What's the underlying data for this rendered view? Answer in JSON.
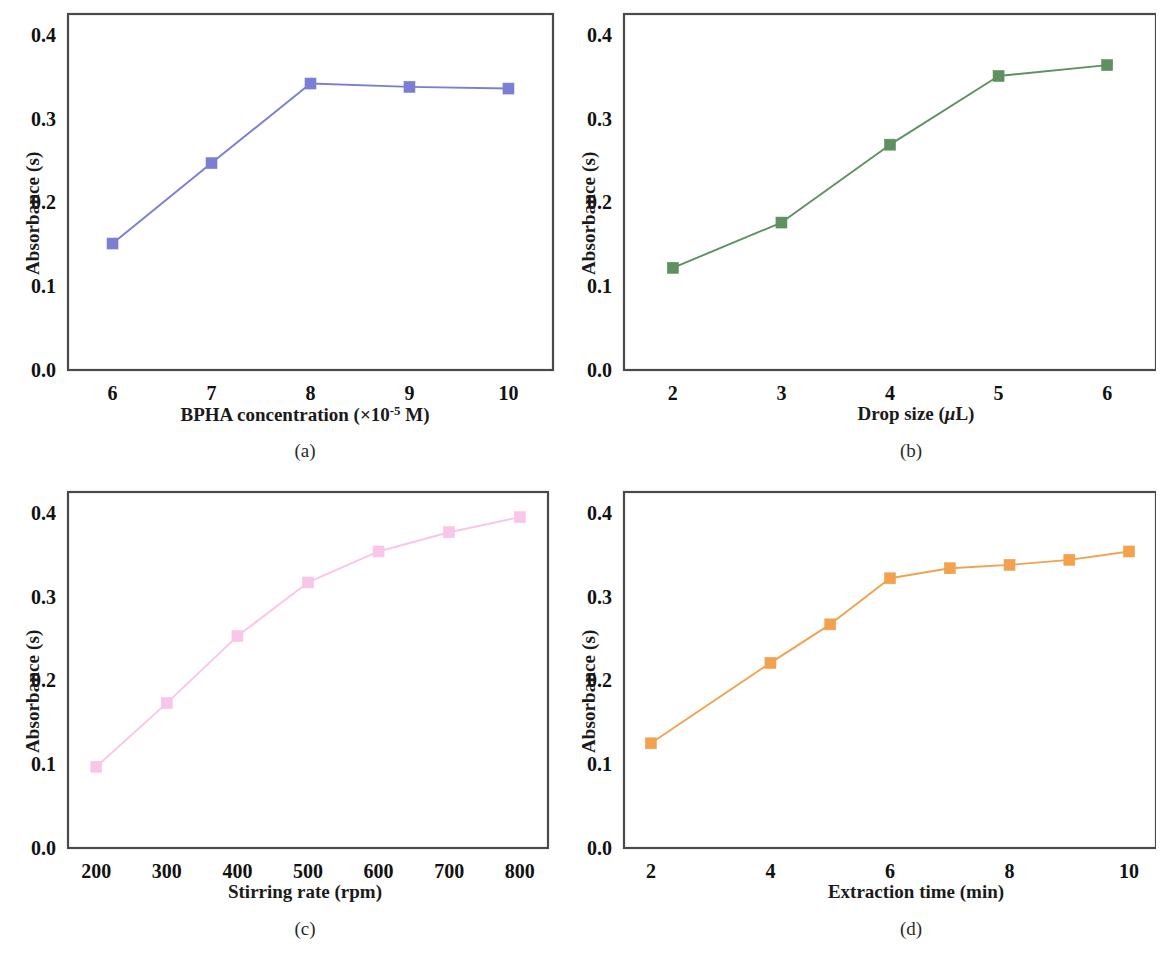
{
  "figure": {
    "ylabel": "Absorbance (s)",
    "yticks": [
      "0.0",
      "0.1",
      "0.2",
      "0.3",
      "0.4"
    ],
    "ytick_values": [
      0.0,
      0.1,
      0.2,
      0.3,
      0.4
    ],
    "axis_color": "#4a4a4a"
  },
  "panels": {
    "a": {
      "caption": "(a)",
      "xlabel_prefix": "BPHA concentration (×10",
      "xlabel_sup": "-5",
      "xlabel_suffix": " M)",
      "series_color": "#7b7fd4",
      "marker_color": "#7b7fd4"
    },
    "b": {
      "caption": "(b)",
      "xlabel_prefix": "Drop size (",
      "xlabel_mu": "μ",
      "xlabel_suffix": "L)",
      "series_color": "#5f9160",
      "marker_color": "#5f9160"
    },
    "c": {
      "caption": "(c)",
      "xlabel_prefix": "Stirring rate (rpm)",
      "series_color": "#f9c5e8",
      "marker_color": "#fbb8e4"
    },
    "d": {
      "caption": "(d)",
      "xlabel_prefix": "Extraction time (min)",
      "series_color": "#f2a24e",
      "marker_color": "#f5a355"
    }
  },
  "chart_data": [
    {
      "type": "line",
      "panel": "a",
      "title": "",
      "xlabel": "BPHA concentration (×10-5 M)",
      "ylabel": "Absorbance (s)",
      "categories": [
        6,
        7,
        8,
        9,
        10
      ],
      "tick_labels": [
        "6",
        "7",
        "8",
        "9",
        "10"
      ],
      "values": [
        0.151,
        0.247,
        0.342,
        0.338,
        0.336
      ],
      "xlim": [
        5.55,
        10.45
      ],
      "ylim": [
        0.0,
        0.425
      ],
      "grid": false,
      "legend": "none",
      "color": "#7b7fd4",
      "marker": "square"
    },
    {
      "type": "line",
      "panel": "b",
      "title": "",
      "xlabel": "Drop size (μL)",
      "ylabel": "Absorbance (s)",
      "categories": [
        2,
        3,
        4,
        5,
        6
      ],
      "tick_labels": [
        "2",
        "3",
        "4",
        "5",
        "6"
      ],
      "values": [
        0.122,
        0.176,
        0.269,
        0.351,
        0.364
      ],
      "xlim": [
        1.55,
        6.45
      ],
      "ylim": [
        0.0,
        0.425
      ],
      "grid": false,
      "legend": "none",
      "color": "#5f9160",
      "marker": "square"
    },
    {
      "type": "line",
      "panel": "c",
      "title": "",
      "xlabel": "Stirring rate (rpm)",
      "ylabel": "Absorbance (s)",
      "categories": [
        200,
        300,
        400,
        500,
        600,
        700,
        800
      ],
      "tick_labels": [
        "200",
        "300",
        "400",
        "500",
        "600",
        "700",
        "800"
      ],
      "values": [
        0.097,
        0.173,
        0.253,
        0.317,
        0.354,
        0.377,
        0.395
      ],
      "xlim": [
        160,
        840
      ],
      "ylim": [
        0.0,
        0.425
      ],
      "grid": false,
      "legend": "none",
      "color": "#f9c5e8",
      "marker": "square"
    },
    {
      "type": "line",
      "panel": "d",
      "title": "",
      "xlabel": "Extraction time (min)",
      "ylabel": "Absorbance (s)",
      "categories": [
        2,
        4,
        5,
        6,
        7,
        8,
        9,
        10
      ],
      "tick_labels": [
        "2",
        "4",
        "6",
        "8",
        "10"
      ],
      "tick_positions": [
        2,
        4,
        6,
        8,
        10
      ],
      "values": [
        0.125,
        0.221,
        0.267,
        0.322,
        0.334,
        0.338,
        0.344,
        0.354
      ],
      "xlim": [
        1.55,
        10.45
      ],
      "ylim": [
        0.0,
        0.425
      ],
      "grid": false,
      "legend": "none",
      "color": "#f2a24e",
      "marker": "square"
    }
  ]
}
